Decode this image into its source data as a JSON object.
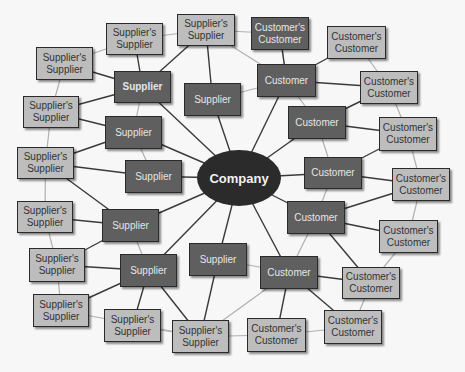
{
  "diagram": {
    "center": {
      "label": "Company"
    },
    "nodes": [
      {
        "id": "ss1",
        "label": "Supplier's Supplier",
        "type": "supplier_supplier",
        "x": 106,
        "y": 23,
        "w": 57,
        "h": 32,
        "style": "light"
      },
      {
        "id": "ss2",
        "label": "Supplier's Supplier",
        "type": "supplier_supplier",
        "x": 177,
        "y": 14,
        "w": 58,
        "h": 32,
        "style": "light"
      },
      {
        "id": "ss3",
        "label": "Supplier's Supplier",
        "type": "supplier_supplier",
        "x": 36,
        "y": 47,
        "w": 57,
        "h": 33,
        "style": "light"
      },
      {
        "id": "ss4",
        "label": "Supplier's Supplier",
        "type": "supplier_supplier",
        "x": 23,
        "y": 96,
        "w": 56,
        "h": 32,
        "style": "light"
      },
      {
        "id": "ss5",
        "label": "Supplier's Supplier",
        "type": "supplier_supplier",
        "x": 17,
        "y": 147,
        "w": 57,
        "h": 32,
        "style": "light"
      },
      {
        "id": "ss6",
        "label": "Supplier's Supplier",
        "type": "supplier_supplier",
        "x": 17,
        "y": 201,
        "w": 56,
        "h": 32,
        "style": "light"
      },
      {
        "id": "ss7",
        "label": "Supplier's Supplier",
        "type": "supplier_supplier",
        "x": 29,
        "y": 248,
        "w": 56,
        "h": 34,
        "style": "light"
      },
      {
        "id": "ss8",
        "label": "Supplier's Supplier",
        "type": "supplier_supplier",
        "x": 33,
        "y": 294,
        "w": 56,
        "h": 33,
        "style": "light"
      },
      {
        "id": "ss9",
        "label": "Supplier's Supplier",
        "type": "supplier_supplier",
        "x": 104,
        "y": 309,
        "w": 57,
        "h": 33,
        "style": "light"
      },
      {
        "id": "ss10",
        "label": "Supplier's Supplier",
        "type": "supplier_supplier",
        "x": 172,
        "y": 320,
        "w": 57,
        "h": 33,
        "style": "light"
      },
      {
        "id": "s1",
        "label": "Supplier",
        "type": "supplier",
        "x": 114,
        "y": 71,
        "w": 57,
        "h": 32,
        "style": "dark",
        "bold": true
      },
      {
        "id": "s2",
        "label": "Supplier",
        "type": "supplier",
        "x": 184,
        "y": 83,
        "w": 57,
        "h": 33,
        "style": "dark"
      },
      {
        "id": "s3",
        "label": "Supplier",
        "type": "supplier",
        "x": 105,
        "y": 116,
        "w": 57,
        "h": 33,
        "style": "dark"
      },
      {
        "id": "s4",
        "label": "Supplier",
        "type": "supplier",
        "x": 125,
        "y": 160,
        "w": 57,
        "h": 33,
        "style": "dark"
      },
      {
        "id": "s5",
        "label": "Supplier",
        "type": "supplier",
        "x": 102,
        "y": 209,
        "w": 57,
        "h": 33,
        "style": "dark"
      },
      {
        "id": "s6",
        "label": "Supplier",
        "type": "supplier",
        "x": 120,
        "y": 254,
        "w": 57,
        "h": 33,
        "style": "dark"
      },
      {
        "id": "s7",
        "label": "Supplier",
        "type": "supplier",
        "x": 189,
        "y": 243,
        "w": 58,
        "h": 33,
        "style": "dark"
      },
      {
        "id": "c1",
        "label": "Customer",
        "type": "customer",
        "x": 257,
        "y": 64,
        "w": 59,
        "h": 33,
        "style": "dark"
      },
      {
        "id": "c2",
        "label": "Customer",
        "type": "customer",
        "x": 288,
        "y": 106,
        "w": 58,
        "h": 33,
        "style": "dark"
      },
      {
        "id": "c3",
        "label": "Customer",
        "type": "customer",
        "x": 304,
        "y": 157,
        "w": 58,
        "h": 32,
        "style": "dark"
      },
      {
        "id": "c4",
        "label": "Customer",
        "type": "customer",
        "x": 287,
        "y": 201,
        "w": 58,
        "h": 33,
        "style": "dark"
      },
      {
        "id": "c5",
        "label": "Customer",
        "type": "customer",
        "x": 260,
        "y": 256,
        "w": 58,
        "h": 33,
        "style": "dark"
      },
      {
        "id": "cc1",
        "label": "Customer's Customer",
        "type": "customer_customer",
        "x": 251,
        "y": 17,
        "w": 58,
        "h": 33,
        "style": "dark"
      },
      {
        "id": "cc2",
        "label": "Customer's Customer",
        "type": "customer_customer",
        "x": 327,
        "y": 26,
        "w": 59,
        "h": 33,
        "style": "light"
      },
      {
        "id": "cc3",
        "label": "Customer's Customer",
        "type": "customer_customer",
        "x": 360,
        "y": 71,
        "w": 58,
        "h": 33,
        "style": "light"
      },
      {
        "id": "cc4",
        "label": "Customer's Customer",
        "type": "customer_customer",
        "x": 379,
        "y": 117,
        "w": 58,
        "h": 34,
        "style": "light"
      },
      {
        "id": "cc5",
        "label": "Customer's Customer",
        "type": "customer_customer",
        "x": 392,
        "y": 168,
        "w": 58,
        "h": 33,
        "style": "light"
      },
      {
        "id": "cc6",
        "label": "Customer's Customer",
        "type": "customer_customer",
        "x": 379,
        "y": 220,
        "w": 59,
        "h": 33,
        "style": "light"
      },
      {
        "id": "cc7",
        "label": "Customer's Customer",
        "type": "customer_customer",
        "x": 342,
        "y": 267,
        "w": 58,
        "h": 32,
        "style": "light"
      },
      {
        "id": "cc8",
        "label": "Customer's Customer",
        "type": "customer_customer",
        "x": 324,
        "y": 310,
        "w": 58,
        "h": 34,
        "style": "light"
      },
      {
        "id": "cc9",
        "label": "Customer's Customer",
        "type": "customer_customer",
        "x": 247,
        "y": 318,
        "w": 59,
        "h": 34,
        "style": "light"
      }
    ],
    "edges_dark": [
      [
        "center",
        "s1"
      ],
      [
        "center",
        "s2"
      ],
      [
        "center",
        "s3"
      ],
      [
        "center",
        "s4"
      ],
      [
        "center",
        "s5"
      ],
      [
        "center",
        "s6"
      ],
      [
        "center",
        "s7"
      ],
      [
        "center",
        "c1"
      ],
      [
        "center",
        "c2"
      ],
      [
        "center",
        "c3"
      ],
      [
        "center",
        "c4"
      ],
      [
        "center",
        "c5"
      ],
      [
        "s1",
        "ss1"
      ],
      [
        "s1",
        "ss3"
      ],
      [
        "s1",
        "ss2"
      ],
      [
        "s1",
        "ss4"
      ],
      [
        "s3",
        "ss4"
      ],
      [
        "s3",
        "ss5"
      ],
      [
        "s4",
        "ss5"
      ],
      [
        "s5",
        "ss5"
      ],
      [
        "s5",
        "ss6"
      ],
      [
        "s5",
        "ss7"
      ],
      [
        "s6",
        "ss7"
      ],
      [
        "s6",
        "ss8"
      ],
      [
        "s6",
        "ss9"
      ],
      [
        "s6",
        "ss10"
      ],
      [
        "s7",
        "ss10"
      ],
      [
        "s2",
        "ss2"
      ],
      [
        "c1",
        "cc1"
      ],
      [
        "c1",
        "cc2"
      ],
      [
        "c1",
        "cc3"
      ],
      [
        "c2",
        "cc4"
      ],
      [
        "c2",
        "cc3"
      ],
      [
        "c3",
        "cc4"
      ],
      [
        "c3",
        "cc5"
      ],
      [
        "c4",
        "cc5"
      ],
      [
        "c4",
        "cc6"
      ],
      [
        "c4",
        "cc7"
      ],
      [
        "c5",
        "cc7"
      ],
      [
        "c5",
        "cc8"
      ],
      [
        "c5",
        "cc9"
      ]
    ],
    "edges_light": [
      [
        "ss1",
        "ss2"
      ],
      [
        "ss1",
        "ss3"
      ],
      [
        "ss3",
        "ss4"
      ],
      [
        "ss4",
        "ss5"
      ],
      [
        "ss5",
        "ss6"
      ],
      [
        "ss6",
        "ss7"
      ],
      [
        "ss7",
        "ss8"
      ],
      [
        "ss8",
        "ss10"
      ],
      [
        "ss9",
        "ss10"
      ],
      [
        "ss2",
        "cc1"
      ],
      [
        "ss2",
        "c1"
      ],
      [
        "cc1",
        "c1"
      ],
      [
        "cc2",
        "cc3"
      ],
      [
        "cc3",
        "cc4"
      ],
      [
        "cc4",
        "cc5"
      ],
      [
        "cc5",
        "cc6"
      ],
      [
        "cc6",
        "cc7"
      ],
      [
        "cc7",
        "cc8"
      ],
      [
        "cc8",
        "cc9"
      ],
      [
        "cc9",
        "ss10"
      ],
      [
        "s1",
        "s3"
      ],
      [
        "s3",
        "s4"
      ],
      [
        "s5",
        "s6"
      ],
      [
        "s2",
        "c1"
      ],
      [
        "s7",
        "c5"
      ],
      [
        "c1",
        "c2"
      ],
      [
        "c2",
        "c3"
      ],
      [
        "c3",
        "c4"
      ],
      [
        "c4",
        "c5"
      ],
      [
        "ss10",
        "c5"
      ]
    ]
  },
  "colors": {
    "background": "#f7f7f7",
    "light_node": "#bdbdbd",
    "dark_node": "#5f5f5f",
    "center": "#2b2b2b",
    "edge_dark": "#3a3a3a",
    "edge_light": "#b0b0b0"
  }
}
